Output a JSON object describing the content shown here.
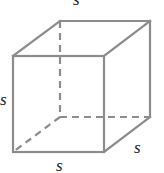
{
  "diagram": {
    "type": "cube",
    "edge_color": "#8c8c8c",
    "vertices": {
      "front_top_left": [
        13,
        56
      ],
      "front_top_right": [
        104,
        56
      ],
      "front_bottom_left": [
        13,
        152
      ],
      "front_bottom_right": [
        104,
        152
      ],
      "back_top_left": [
        60,
        21
      ],
      "back_top_right": [
        150,
        21
      ],
      "back_bottom_left": [
        60,
        117
      ],
      "back_bottom_right": [
        150,
        117
      ]
    },
    "hidden_edges": [
      "back_top_left-back_bottom_left",
      "back_bottom_left-back_bottom_right",
      "back_bottom_left-front_bottom_left"
    ],
    "labels": {
      "top": "s",
      "left": "s",
      "bottom": "s",
      "depth": "s"
    }
  }
}
